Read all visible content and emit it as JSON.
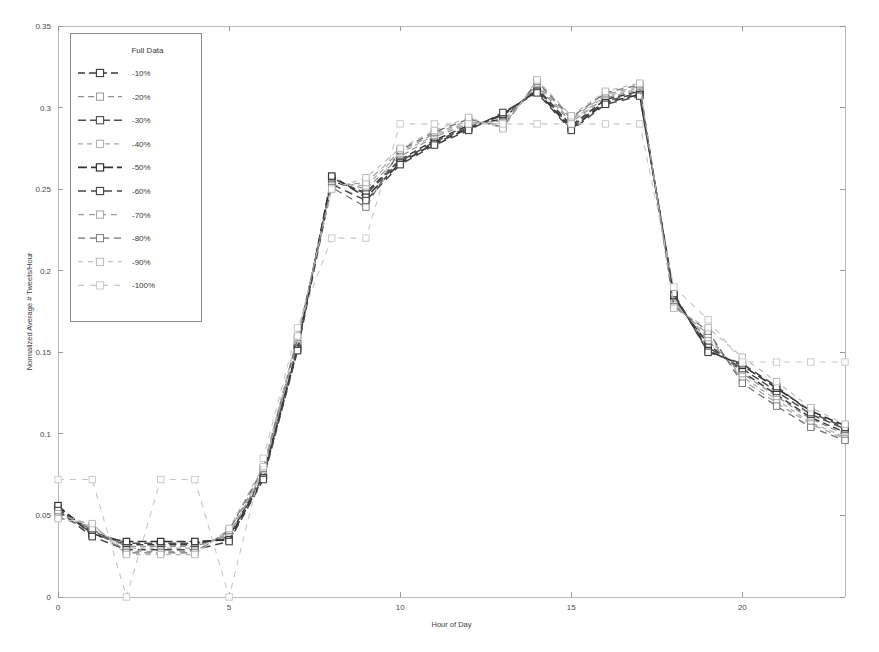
{
  "chart_data": {
    "type": "line",
    "title": "",
    "xlabel": "Hour of Day",
    "ylabel": "Normalized Average # Tweets/Hour",
    "xlim": [
      0,
      23
    ],
    "ylim": [
      0,
      0.35
    ],
    "xticks": [
      0,
      5,
      10,
      15,
      20
    ],
    "xtick_labels": [
      "0",
      "5",
      "10",
      "15",
      "20"
    ],
    "yticks": [
      0,
      0.05,
      0.1,
      0.15,
      0.2,
      0.25,
      0.3,
      0.35
    ],
    "ytick_labels": [
      "0",
      "0.05",
      "0.1",
      "0.15",
      "0.2",
      "0.25",
      "0.3",
      "0.35"
    ],
    "grid": false,
    "legend_position": "upper-left",
    "legend_title": "Full Data",
    "x": [
      0,
      1,
      2,
      3,
      4,
      5,
      6,
      7,
      8,
      9,
      10,
      11,
      12,
      13,
      14,
      15,
      16,
      17,
      18,
      19,
      20,
      21,
      22,
      23
    ],
    "series": [
      {
        "name": "-10%",
        "color": "#3a3a3a",
        "dash": "7,4",
        "width": 1.5,
        "values": [
          0.054,
          0.039,
          0.032,
          0.032,
          0.032,
          0.037,
          0.075,
          0.154,
          0.255,
          0.248,
          0.268,
          0.28,
          0.289,
          0.293,
          0.312,
          0.289,
          0.305,
          0.31,
          0.183,
          0.155,
          0.138,
          0.124,
          0.11,
          0.101
        ]
      },
      {
        "name": "-20%",
        "color": "#8f8f8f",
        "dash": "6,4",
        "width": 1.2,
        "values": [
          0.052,
          0.041,
          0.031,
          0.031,
          0.031,
          0.038,
          0.076,
          0.155,
          0.256,
          0.25,
          0.27,
          0.282,
          0.29,
          0.292,
          0.313,
          0.291,
          0.306,
          0.311,
          0.182,
          0.157,
          0.137,
          0.123,
          0.109,
          0.1
        ]
      },
      {
        "name": "-30%",
        "color": "#4d4d4d",
        "dash": "8,4",
        "width": 1.5,
        "values": [
          0.055,
          0.04,
          0.033,
          0.033,
          0.033,
          0.036,
          0.074,
          0.153,
          0.257,
          0.247,
          0.267,
          0.279,
          0.288,
          0.295,
          0.311,
          0.288,
          0.304,
          0.309,
          0.184,
          0.153,
          0.14,
          0.126,
          0.112,
          0.103
        ]
      },
      {
        "name": "-40%",
        "color": "#a8a8a8",
        "dash": "5,4",
        "width": 1.2,
        "values": [
          0.05,
          0.043,
          0.03,
          0.03,
          0.03,
          0.039,
          0.077,
          0.157,
          0.254,
          0.252,
          0.272,
          0.283,
          0.291,
          0.29,
          0.314,
          0.292,
          0.307,
          0.312,
          0.18,
          0.159,
          0.135,
          0.121,
          0.107,
          0.098
        ]
      },
      {
        "name": "-50%",
        "color": "#333333",
        "dash": "9,4",
        "width": 1.6,
        "values": [
          0.056,
          0.038,
          0.034,
          0.034,
          0.034,
          0.035,
          0.073,
          0.152,
          0.258,
          0.245,
          0.266,
          0.278,
          0.287,
          0.296,
          0.31,
          0.287,
          0.303,
          0.308,
          0.185,
          0.151,
          0.142,
          0.128,
          0.114,
          0.105
        ]
      },
      {
        "name": "-60%",
        "color": "#454545",
        "dash": "8,5",
        "width": 1.5,
        "values": [
          0.053,
          0.037,
          0.029,
          0.029,
          0.029,
          0.034,
          0.072,
          0.151,
          0.253,
          0.243,
          0.265,
          0.277,
          0.286,
          0.297,
          0.309,
          0.286,
          0.302,
          0.307,
          0.186,
          0.15,
          0.143,
          0.129,
          0.113,
          0.104
        ]
      },
      {
        "name": "-70%",
        "color": "#9d9d9d",
        "dash": "6,5",
        "width": 1.2,
        "values": [
          0.051,
          0.044,
          0.028,
          0.028,
          0.028,
          0.04,
          0.078,
          0.158,
          0.252,
          0.254,
          0.273,
          0.284,
          0.292,
          0.289,
          0.315,
          0.293,
          0.308,
          0.313,
          0.179,
          0.161,
          0.133,
          0.119,
          0.106,
          0.097
        ]
      },
      {
        "name": "-80%",
        "color": "#707070",
        "dash": "7,5",
        "width": 1.3,
        "values": [
          0.049,
          0.042,
          0.027,
          0.027,
          0.027,
          0.041,
          0.079,
          0.159,
          0.251,
          0.239,
          0.274,
          0.285,
          0.293,
          0.288,
          0.316,
          0.294,
          0.309,
          0.314,
          0.178,
          0.163,
          0.131,
          0.117,
          0.104,
          0.096
        ]
      },
      {
        "name": "-90%",
        "color": "#b5b5b5",
        "dash": "5,5",
        "width": 1.1,
        "values": [
          0.048,
          0.045,
          0.026,
          0.026,
          0.026,
          0.042,
          0.08,
          0.16,
          0.25,
          0.257,
          0.275,
          0.286,
          0.294,
          0.287,
          0.317,
          0.295,
          0.31,
          0.315,
          0.177,
          0.165,
          0.147,
          0.132,
          0.116,
          0.106
        ]
      },
      {
        "name": "-100%",
        "color": "#c6c6c6",
        "dash": "6,6",
        "width": 1.1,
        "values": [
          0.072,
          0.072,
          0.0,
          0.072,
          0.072,
          0.0,
          0.085,
          0.165,
          0.22,
          0.22,
          0.29,
          0.29,
          0.29,
          0.29,
          0.29,
          0.29,
          0.29,
          0.29,
          0.19,
          0.17,
          0.144,
          0.144,
          0.144,
          0.144
        ]
      }
    ]
  },
  "plot_geometry": {
    "left": 58,
    "right": 845,
    "top": 26,
    "bottom": 597
  },
  "legend_geometry": {
    "x": 70,
    "y": 33,
    "width": 131,
    "height": 288
  }
}
